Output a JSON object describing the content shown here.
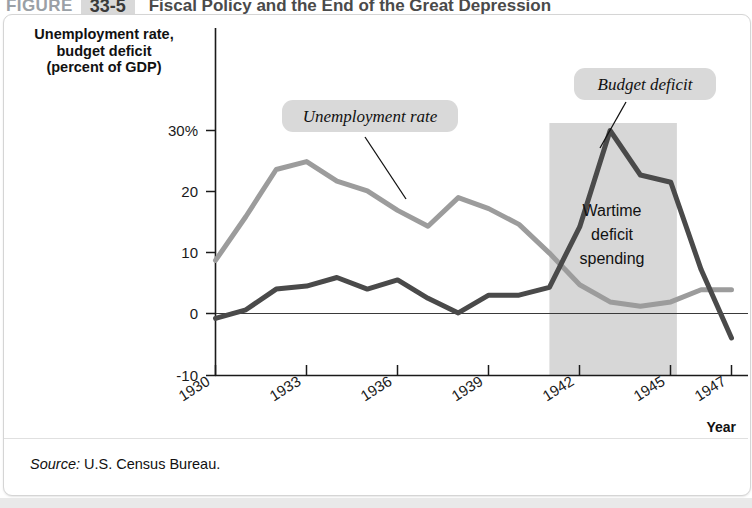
{
  "header": {
    "figure_word": "FIGURE",
    "figure_number": "33-5",
    "title": "Fiscal Policy and the End of the Great Depression"
  },
  "yaxis_title_line1": "Unemployment rate,",
  "yaxis_title_line2": "budget deficit",
  "yaxis_title_line3": "(percent of GDP)",
  "xaxis_label": "Year",
  "source": {
    "prefix": "Source:",
    "text": " U.S. Census Bureau."
  },
  "annotations": {
    "unemployment_callout": "Unemployment rate",
    "deficit_callout": "Budget deficit",
    "wartime_line1": "Wartime",
    "wartime_line2": "deficit",
    "wartime_line3": "spending"
  },
  "colors": {
    "unemployment_line": "#9c9c9c",
    "deficit_line": "#4a4a4a",
    "shaded_band": "#d7d7d7",
    "callout_bg": "#d9d9d9",
    "axis": "#1a1a1a"
  },
  "chart_data": {
    "type": "line",
    "title": "Fiscal Policy and the End of the Great Depression",
    "xlabel": "Year",
    "ylabel": "Unemployment rate, budget deficit (percent of GDP)",
    "xlim": [
      1930,
      1947
    ],
    "ylim": [
      -10,
      33
    ],
    "ytick_values": [
      30,
      20,
      10,
      0,
      -10
    ],
    "ytick_labels": [
      "30%",
      "20",
      "10",
      "0",
      "-10"
    ],
    "xtick_values": [
      1930,
      1933,
      1936,
      1939,
      1942,
      1945,
      1947
    ],
    "xtick_labels": [
      "1930",
      "1933",
      "1936",
      "1939",
      "1942",
      "1945",
      "1947"
    ],
    "grid": false,
    "legend": "callout-labels",
    "x": [
      1930,
      1931,
      1932,
      1933,
      1934,
      1935,
      1936,
      1937,
      1938,
      1939,
      1940,
      1941,
      1942,
      1943,
      1944,
      1945,
      1946,
      1947
    ],
    "series": [
      {
        "name": "Unemployment rate",
        "color": "#9c9c9c",
        "values": [
          8.7,
          15.9,
          23.6,
          24.9,
          21.7,
          20.1,
          16.9,
          14.3,
          19.0,
          17.2,
          14.6,
          9.9,
          4.7,
          1.9,
          1.2,
          1.9,
          3.9,
          3.9
        ]
      },
      {
        "name": "Budget deficit",
        "color": "#4a4a4a",
        "values": [
          -0.8,
          0.6,
          4.0,
          4.5,
          5.9,
          4.0,
          5.5,
          2.5,
          0.1,
          3.0,
          3.0,
          4.3,
          14.2,
          30.0,
          22.7,
          21.5,
          7.2,
          -4.0
        ]
      }
    ],
    "shaded_region": {
      "label": "Wartime deficit spending",
      "x_start": 1941,
      "x_end": 1945.2,
      "color": "#d7d7d7"
    },
    "annotations": [
      {
        "text": "Unemployment rate",
        "series": "Unemployment rate",
        "points_to_x": 1937
      },
      {
        "text": "Budget deficit",
        "series": "Budget deficit",
        "points_to_x": 1943
      }
    ]
  }
}
